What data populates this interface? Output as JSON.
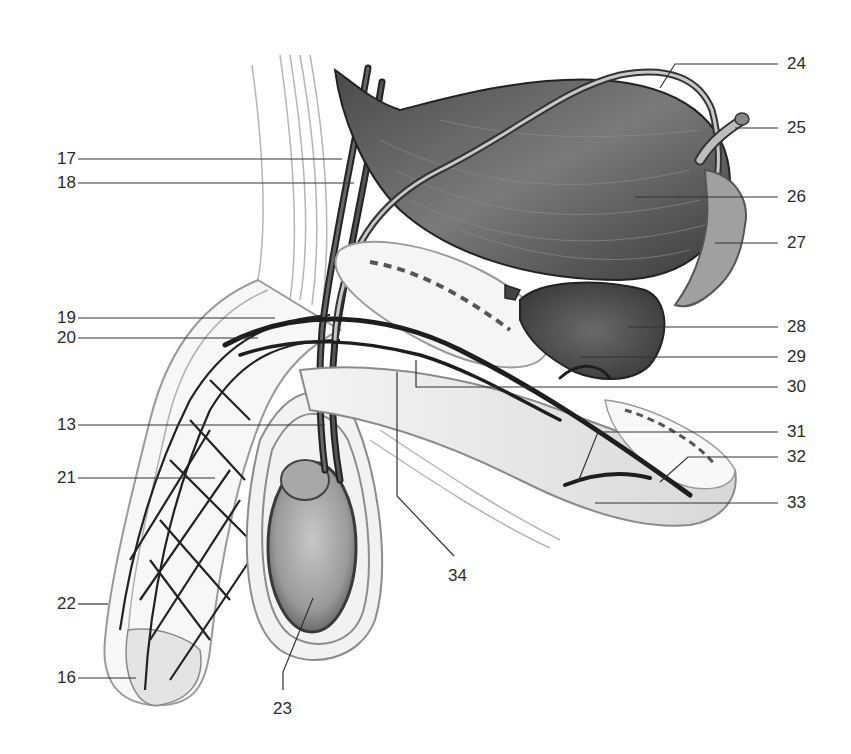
{
  "diagram": {
    "type": "anatomical-illustration",
    "colors": {
      "background": "#ffffff",
      "line": "#2a2a2a",
      "muscle_dark": "#3a3a3a",
      "muscle_mid": "#6e6e6e",
      "tissue_light": "#e6e6e6",
      "vessel": "#1e1e1e"
    }
  },
  "labels": {
    "left": [
      {
        "id": "17",
        "text": "17",
        "x": 36,
        "y": 149
      },
      {
        "id": "18",
        "text": "18",
        "x": 36,
        "y": 173
      },
      {
        "id": "19",
        "text": "19",
        "x": 36,
        "y": 308
      },
      {
        "id": "20",
        "text": "20",
        "x": 36,
        "y": 328
      },
      {
        "id": "13",
        "text": "13",
        "x": 36,
        "y": 415
      },
      {
        "id": "21",
        "text": "21",
        "x": 36,
        "y": 468
      },
      {
        "id": "22",
        "text": "22",
        "x": 36,
        "y": 594
      },
      {
        "id": "16",
        "text": "16",
        "x": 36,
        "y": 668
      }
    ],
    "right": [
      {
        "id": "24",
        "text": "24",
        "x": 787,
        "y": 54
      },
      {
        "id": "25",
        "text": "25",
        "x": 787,
        "y": 118
      },
      {
        "id": "26",
        "text": "26",
        "x": 787,
        "y": 187
      },
      {
        "id": "27",
        "text": "27",
        "x": 787,
        "y": 233
      },
      {
        "id": "28",
        "text": "28",
        "x": 787,
        "y": 317
      },
      {
        "id": "29",
        "text": "29",
        "x": 787,
        "y": 347
      },
      {
        "id": "30",
        "text": "30",
        "x": 787,
        "y": 377
      },
      {
        "id": "31",
        "text": "31",
        "x": 787,
        "y": 422
      },
      {
        "id": "32",
        "text": "32",
        "x": 787,
        "y": 447
      },
      {
        "id": "33",
        "text": "33",
        "x": 787,
        "y": 493
      }
    ],
    "bottom": [
      {
        "id": "34",
        "text": "34",
        "x": 458,
        "y": 566
      },
      {
        "id": "23",
        "text": "23",
        "x": 275,
        "y": 699
      }
    ]
  }
}
